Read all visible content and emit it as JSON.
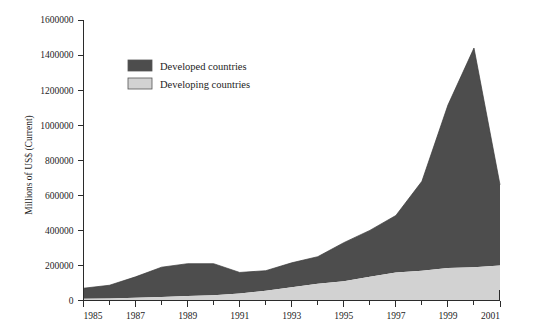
{
  "chart_data": {
    "type": "area",
    "stacked": true,
    "title": "",
    "subtitle": "",
    "xlabel": "",
    "ylabel": "Millions of US$ (Current)",
    "xlim": [
      1985,
      2001
    ],
    "ylim": [
      0,
      1600000
    ],
    "grid": false,
    "legend_position": "top-left-inside",
    "x": [
      1985,
      1986,
      1987,
      1988,
      1989,
      1990,
      1991,
      1992,
      1993,
      1994,
      1995,
      1996,
      1997,
      1998,
      1999,
      2000,
      2001
    ],
    "xtick_labels": [
      "1985",
      "1987",
      "1989",
      "1991",
      "1993",
      "1995",
      "1997",
      "1999",
      "2001"
    ],
    "xtick_values": [
      1985,
      1987,
      1989,
      1991,
      1993,
      1995,
      1997,
      1999,
      2001
    ],
    "xtick_minor_values": [
      1986,
      1988,
      1990,
      1992,
      1994,
      1996,
      1998,
      2000
    ],
    "ytick_labels": [
      "0",
      "200000",
      "400000",
      "600000",
      "800000",
      "1000000",
      "1200000",
      "1400000",
      "1600000"
    ],
    "ytick_values": [
      0,
      200000,
      400000,
      600000,
      800000,
      1000000,
      1200000,
      1400000,
      1600000
    ],
    "series": [
      {
        "name": "Developing countries",
        "color": "#d2d2d2",
        "values": [
          10000,
          12000,
          15000,
          20000,
          25000,
          30000,
          40000,
          55000,
          75000,
          95000,
          110000,
          135000,
          160000,
          170000,
          185000,
          190000,
          200000
        ]
      },
      {
        "name": "Developed countries",
        "color": "#4d4d4d",
        "values": [
          60000,
          75000,
          120000,
          170000,
          185000,
          180000,
          120000,
          115000,
          140000,
          155000,
          220000,
          265000,
          325000,
          510000,
          930000,
          1250000,
          460000
        ]
      }
    ],
    "totals": [
      70000,
      87000,
      135000,
      190000,
      210000,
      210000,
      160000,
      170000,
      215000,
      250000,
      330000,
      400000,
      485000,
      680000,
      1115000,
      1440000,
      660000
    ],
    "annotations": []
  },
  "legend": {
    "entries": [
      {
        "label": "Developed countries",
        "color": "#4d4d4d"
      },
      {
        "label": "Developing countries",
        "color": "#d2d2d2"
      }
    ]
  }
}
